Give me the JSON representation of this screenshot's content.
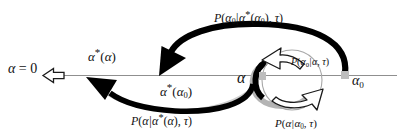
{
  "figure": {
    "type": "schematic-diagram",
    "background_color": "#ffffff",
    "axis": {
      "name": "alpha-axis",
      "orientation": "horizontal",
      "color": "#8a8a8a",
      "origin_label": "alpha = 0"
    }
  },
  "axis_labels": {
    "origin": {
      "alpha": "α",
      "equals": " = ",
      "value": "0"
    },
    "alpha_star_of_alpha": {
      "base": "α",
      "star": "*",
      "arg_open": "(",
      "arg": "α",
      "arg_close": ")"
    },
    "alpha_star_of_alpha0": {
      "base": "α",
      "star": "*",
      "arg_open": "(",
      "arg": "α",
      "arg_sub": "0",
      "arg_close": ")"
    },
    "alpha_mid": {
      "base": "α"
    },
    "alpha_zero_right": {
      "base": "α",
      "sub": "0"
    }
  },
  "probability_labels": {
    "top": {
      "id": "P-alpha0-given-alphastar-alpha0-tau",
      "p": "P",
      "open": "(",
      "lhs": "α",
      "lhs_sub": "0",
      "bar": "|",
      "rhs": "α",
      "rhs_star": "*",
      "rhs_arg_open": "(",
      "rhs_arg": "α",
      "rhs_arg_sub": "0",
      "rhs_arg_close": ")",
      "comma": ", ",
      "tau": "τ",
      "close": ")"
    },
    "bottom_left": {
      "id": "P-alpha-given-alphastar-alpha-tau",
      "p": "P",
      "open": "(",
      "lhs": "α",
      "bar": "|",
      "rhs": "α",
      "rhs_star": "*",
      "rhs_arg_open": "(",
      "rhs_arg": "α",
      "rhs_arg_close": ")",
      "comma": ", ",
      "tau": "τ",
      "close": ")"
    },
    "bottom_right": {
      "id": "P-alpha-given-alpha0-tau",
      "p": "P",
      "open": "(",
      "lhs": "α",
      "bar": "|",
      "rhs": "α",
      "rhs_sub": "0",
      "comma": ", ",
      "tau": "τ",
      "close": ")"
    },
    "inner": {
      "id": "P-alpha0-given-alpha-tau",
      "p": "P",
      "open": "(",
      "lhs": "α",
      "lhs_sub": "0",
      "bar": "|",
      "rhs": "α",
      "comma": ", ",
      "tau": "τ",
      "close": ")"
    }
  },
  "arrows": {
    "origin_arrow": {
      "name": "hollow-left-arrow",
      "style": "hollow-outline",
      "direction": "left",
      "fill": "#ffffff",
      "stroke": "#1a1a1a"
    },
    "big_top_arc": {
      "name": "solid-arc-right-to-left-upper",
      "style": "solid-thick",
      "color": "#000000",
      "from": "alpha_0",
      "to": "alpha_star_of_alpha0",
      "head": "down-left"
    },
    "big_bottom_arc": {
      "name": "solid-arc-right-to-left-lower",
      "style": "solid-thick",
      "color": "#000000",
      "from": "alpha",
      "to": "alpha_star_of_alpha",
      "head": "up-left"
    },
    "inner_top_arc": {
      "name": "hollow-arc-upper-left",
      "style": "hollow-outline",
      "fill": "#ffffff",
      "stroke": "#1a1a1a",
      "head": "up-left"
    },
    "inner_bottom_arc": {
      "name": "hollow-arc-lower-right",
      "style": "hollow-outline",
      "fill": "#ffffff",
      "stroke": "#1a1a1a",
      "head": "up-right"
    },
    "shadow_arc": {
      "name": "gray-shadow-arc",
      "color": "#b0b0b0"
    }
  },
  "markers": {
    "alpha_tick": {
      "name": "axis-tick-alpha",
      "color": "#b5b5b5"
    },
    "alpha0_tick": {
      "name": "axis-tick-alpha0",
      "color": "#b5b5b5"
    }
  }
}
